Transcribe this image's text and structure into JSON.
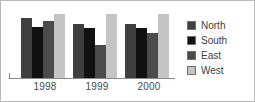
{
  "chart_data": {
    "type": "bar",
    "title": "",
    "xlabel": "",
    "ylabel": "",
    "categories": [
      "1998",
      "1999",
      "2000"
    ],
    "ylim": [
      0,
      100
    ],
    "grid": false,
    "legend_position": "right",
    "series": [
      {
        "name": "North",
        "color": "#3f3f3f",
        "values": [
          85,
          76,
          76
        ]
      },
      {
        "name": "South",
        "color": "#111111",
        "values": [
          72,
          71,
          71
        ]
      },
      {
        "name": "East",
        "color": "#4b4b4b",
        "values": [
          81,
          47,
          64
        ]
      },
      {
        "name": "West",
        "color": "#c4c4c4",
        "values": [
          90,
          90,
          90
        ]
      }
    ]
  },
  "axis": {
    "tick_labels": [
      "1998",
      "1999",
      "2000"
    ]
  },
  "legend": {
    "entries": [
      {
        "label": "North",
        "color": "#3f3f3f"
      },
      {
        "label": "South",
        "color": "#111111"
      },
      {
        "label": "East",
        "color": "#4b4b4b"
      },
      {
        "label": "West",
        "color": "#c4c4c4"
      }
    ]
  }
}
